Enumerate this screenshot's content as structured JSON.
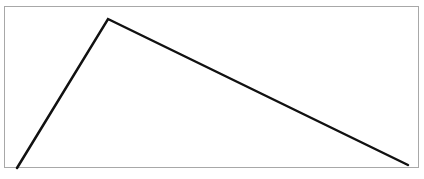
{
  "figure": {
    "type": "triangle-outline",
    "frame": {
      "border_color": "#a8a8a8"
    },
    "stroke_color": "#111111",
    "stroke_width": 2.5,
    "vertices": {
      "apex": {
        "x": 108,
        "y": 19
      },
      "bottom_left": {
        "x": 17,
        "y": 168
      },
      "bottom_right": {
        "x": 408,
        "y": 165
      }
    },
    "caption_fragment": ""
  }
}
